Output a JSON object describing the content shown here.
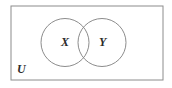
{
  "figure": {
    "type": "venn-diagram",
    "universe_label": "U",
    "set_labels": {
      "left": "X",
      "right": "Y"
    },
    "colors": {
      "background": "#ffffff",
      "stroke": "#8c8c8c",
      "text": "#2b2b2b"
    },
    "geometry": {
      "rectangle": {
        "x": 11,
        "y": 6,
        "width": 152,
        "height": 74
      },
      "circle_left": {
        "cx": 65,
        "cy": 42.5,
        "r": 24
      },
      "circle_right": {
        "cx": 102,
        "cy": 42.5,
        "r": 24
      }
    }
  }
}
